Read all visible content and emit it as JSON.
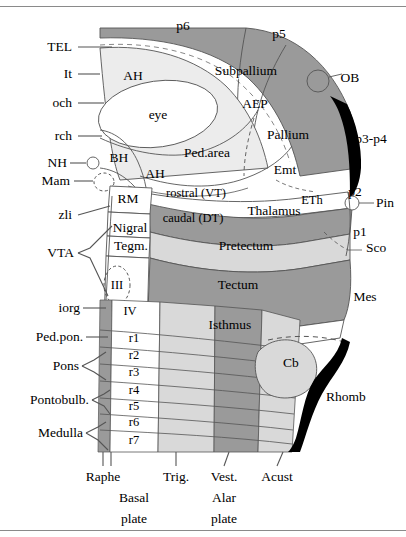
{
  "figure": {
    "kind": "prosomeric-brain-schematic",
    "colors": {
      "background": "#ffffff",
      "dark_gray": "#9a9a9a",
      "mid_gray": "#b9b9b9",
      "light_gray": "#d9d9d9",
      "pale_gray": "#ececec",
      "black": "#000000",
      "stroke": "#555555",
      "rule": "#8a8a8a"
    }
  },
  "left_labels": [
    {
      "id": "TEL",
      "text": "TEL",
      "x": 72,
      "y": 47,
      "leader": {
        "x1": 78,
        "y1": 47,
        "x2": 112,
        "y2": 47
      }
    },
    {
      "id": "It",
      "text": "It",
      "x": 72,
      "y": 74,
      "leader": {
        "x1": 78,
        "y1": 74,
        "x2": 100,
        "y2": 74
      }
    },
    {
      "id": "och",
      "text": "och",
      "x": 72,
      "y": 103,
      "leader": {
        "x1": 78,
        "y1": 103,
        "x2": 104,
        "y2": 103
      }
    },
    {
      "id": "rch",
      "text": "rch",
      "x": 72,
      "y": 136,
      "leader": {
        "x1": 78,
        "y1": 136,
        "x2": 102,
        "y2": 136
      }
    },
    {
      "id": "NH",
      "text": "NH",
      "x": 67,
      "y": 163,
      "leader": {
        "x1": 72,
        "y1": 163,
        "x2": 86,
        "y2": 163
      }
    },
    {
      "id": "Mam",
      "text": "Mam",
      "x": 67,
      "y": 181,
      "leader": {
        "x1": 72,
        "y1": 181,
        "x2": 90,
        "y2": 181
      }
    },
    {
      "id": "zli",
      "text": "zli",
      "x": 72,
      "y": 215,
      "leader": {
        "x1": 78,
        "y1": 215,
        "x2": 108,
        "y2": 208
      }
    },
    {
      "id": "VTA",
      "text": "VTA",
      "x": 72,
      "y": 253
    },
    {
      "id": "iorg",
      "text": "iorg",
      "x": 78,
      "y": 308,
      "leader": {
        "x1": 83,
        "y1": 308,
        "x2": 106,
        "y2": 308
      }
    },
    {
      "id": "Ped.pon.",
      "text": "Ped.pon.",
      "x": 78,
      "y": 337,
      "leader": {
        "x1": 83,
        "y1": 337,
        "x2": 106,
        "y2": 337
      }
    },
    {
      "id": "Pons",
      "text": "Pons",
      "x": 78,
      "y": 366
    },
    {
      "id": "Pontobulb.",
      "text": "Pontobulb.",
      "x": 85,
      "y": 400
    },
    {
      "id": "Medulla",
      "text": "Medulla",
      "x": 80,
      "y": 433
    }
  ],
  "region_labels": [
    {
      "id": "p6",
      "text": "p6",
      "x": 183,
      "y": 26,
      "size": 13
    },
    {
      "id": "p5",
      "text": "p5",
      "x": 279,
      "y": 34,
      "size": 13
    },
    {
      "id": "AH-upper",
      "text": "AH",
      "x": 133,
      "y": 76,
      "size": 13
    },
    {
      "id": "Subpallium",
      "text": "Subpallium",
      "x": 246,
      "y": 71,
      "size": 13
    },
    {
      "id": "OB",
      "text": "OB",
      "x": 348,
      "y": 78,
      "size": 13
    },
    {
      "id": "eye",
      "text": "eye",
      "x": 158,
      "y": 115,
      "size": 13
    },
    {
      "id": "AEP",
      "text": "AEP",
      "x": 255,
      "y": 104,
      "size": 13
    },
    {
      "id": "Pallium",
      "text": "Pallium",
      "x": 288,
      "y": 135,
      "size": 13
    },
    {
      "id": "p3-p4",
      "text": "p3-p4",
      "x": 371,
      "y": 139,
      "size": 13
    },
    {
      "id": "BH",
      "text": "BH",
      "x": 119,
      "y": 158,
      "size": 13
    },
    {
      "id": "AH-lower",
      "text": "AH",
      "x": 155,
      "y": 174,
      "size": 13
    },
    {
      "id": "Ped.area",
      "text": "Ped.area",
      "x": 207,
      "y": 153,
      "size": 13
    },
    {
      "id": "Emt",
      "text": "Emt",
      "x": 285,
      "y": 170,
      "size": 13
    },
    {
      "id": "ETh",
      "text": "ETh",
      "x": 312,
      "y": 200,
      "size": 12
    },
    {
      "id": "p2",
      "text": "p2",
      "x": 355,
      "y": 192,
      "size": 13
    },
    {
      "id": "Pin",
      "text": "Pin",
      "x": 383,
      "y": 203,
      "size": 13
    },
    {
      "id": "RM",
      "text": "RM",
      "x": 128,
      "y": 199,
      "size": 13
    },
    {
      "id": "rostral-VT",
      "text": "rostral (VT)",
      "x": 196,
      "y": 193,
      "size": 12
    },
    {
      "id": "Thalamus",
      "text": "Thalamus",
      "x": 274,
      "y": 211,
      "size": 13
    },
    {
      "id": "Nigral",
      "text": "Nigral",
      "x": 130,
      "y": 228,
      "size": 13
    },
    {
      "id": "caudal-DT",
      "text": "caudal (DT)",
      "x": 193,
      "y": 218,
      "size": 12
    },
    {
      "id": "p1",
      "text": "p1",
      "x": 360,
      "y": 232,
      "size": 13
    },
    {
      "id": "Tegm.",
      "text": "Tegm.",
      "x": 131,
      "y": 246,
      "size": 13
    },
    {
      "id": "Pretectum",
      "text": "Pretectum",
      "x": 246,
      "y": 246,
      "size": 13
    },
    {
      "id": "Sco",
      "text": "Sco",
      "x": 374,
      "y": 248,
      "size": 13
    },
    {
      "id": "III",
      "text": "III",
      "x": 117,
      "y": 285,
      "size": 12
    },
    {
      "id": "Tectum",
      "text": "Tectum",
      "x": 238,
      "y": 285,
      "size": 13
    },
    {
      "id": "Mes",
      "text": "Mes",
      "x": 365,
      "y": 297,
      "size": 13
    },
    {
      "id": "IV",
      "text": "IV",
      "x": 129,
      "y": 311,
      "size": 12
    },
    {
      "id": "Isthmus",
      "text": "Isthmus",
      "x": 230,
      "y": 325,
      "size": 13
    },
    {
      "id": "Cb",
      "text": "Cb",
      "x": 291,
      "y": 363,
      "size": 13
    },
    {
      "id": "Rhomb",
      "text": "Rhomb",
      "x": 346,
      "y": 397,
      "size": 13
    }
  ],
  "rhombomeres": [
    {
      "id": "r1",
      "text": "r1",
      "x": 134,
      "y": 338
    },
    {
      "id": "r2",
      "text": "r2",
      "x": 134,
      "y": 355
    },
    {
      "id": "r3",
      "text": "r3",
      "x": 134,
      "y": 372
    },
    {
      "id": "r4",
      "text": "r4",
      "x": 134,
      "y": 390
    },
    {
      "id": "r5",
      "text": "r5",
      "x": 134,
      "y": 406
    },
    {
      "id": "r6",
      "text": "r6",
      "x": 134,
      "y": 422
    },
    {
      "id": "r7",
      "text": "r7",
      "x": 134,
      "y": 440
    }
  ],
  "bottom_labels": [
    {
      "id": "Raphe",
      "text": "Raphe",
      "x": 103,
      "y": 477,
      "tick": {
        "x1": 103,
        "y1": 452,
        "x2": 103,
        "y2": 466
      }
    },
    {
      "id": "Trig.",
      "text": "Trig.",
      "x": 176,
      "y": 477,
      "tick": {
        "x1": 176,
        "y1": 452,
        "x2": 176,
        "y2": 466
      }
    },
    {
      "id": "Vest.",
      "text": "Vest.",
      "x": 224,
      "y": 477,
      "tick": {
        "x1": 229,
        "y1": 452,
        "x2": 224,
        "y2": 466
      }
    },
    {
      "id": "Acust",
      "text": "Acust",
      "x": 275,
      "y": 477,
      "tick": {
        "x1": 281,
        "y1": 452,
        "x2": 275,
        "y2": 466
      }
    }
  ],
  "plate_labels": [
    {
      "id": "basal-plate",
      "line1": "Basal",
      "line2": "plate",
      "x": 134,
      "y": 498
    },
    {
      "id": "alar-plate",
      "line1": "Alar",
      "line2": "plate",
      "x": 224,
      "y": 498
    }
  ]
}
